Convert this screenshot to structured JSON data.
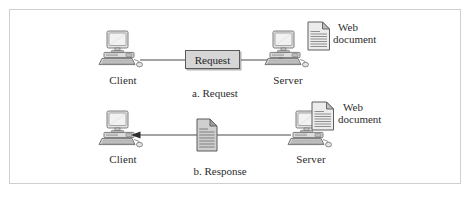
{
  "figure": {
    "border_color": "#cfcfcf",
    "background": "#ffffff",
    "line_color": "#4a4a4a",
    "icon_fill": "#d9d9d9",
    "icon_stroke": "#6b6b6b"
  },
  "part_a": {
    "caption": "a. Request",
    "client_label": "Client",
    "server_label": "Server",
    "message_label": "Request",
    "web_document_line1": "Web",
    "web_document_line2": "document",
    "arrow_direction": "left-to-right",
    "client_icon": "computer-icon",
    "server_icon": "computer-icon",
    "document_icon": "web-document-icon"
  },
  "part_b": {
    "caption": "b. Response",
    "client_label": "Client",
    "server_label": "Server",
    "web_document_line1": "Web",
    "web_document_line2": "document",
    "arrow_direction": "right-to-left",
    "client_icon": "computer-icon",
    "server_icon": "computer-icon",
    "document_icon": "web-document-icon",
    "response_icon": "response-document-icon"
  }
}
